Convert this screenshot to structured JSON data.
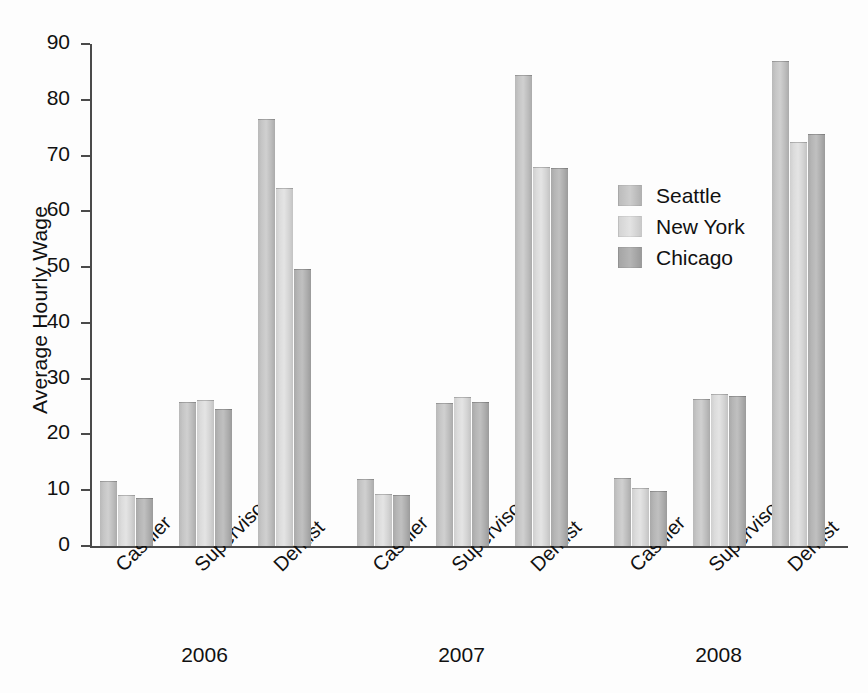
{
  "chart_data": {
    "type": "bar",
    "title": "",
    "xlabel": "",
    "ylabel": "Average Hourly Wage",
    "ylim": [
      0,
      90
    ],
    "ytick_values": [
      0,
      10,
      20,
      30,
      40,
      50,
      60,
      70,
      80,
      90
    ],
    "ytick_labels": [
      "0",
      "10",
      "20",
      "30",
      "40",
      "50",
      "60",
      "70",
      "80",
      "90"
    ],
    "grid": false,
    "legend_position": "upper-right-inside",
    "group_labels": [
      "2006",
      "2007",
      "2008"
    ],
    "categories": [
      "Cashier",
      "Supervisor",
      "Dentist"
    ],
    "series": [
      {
        "name": "Seattle",
        "color": "#c4c4c4",
        "values_by_group": {
          "2006": {
            "Cashier": 11.5,
            "Supervisor": 25.7,
            "Dentist": 76.3
          },
          "2007": {
            "Cashier": 11.8,
            "Supervisor": 25.5,
            "Dentist": 84.2
          },
          "2008": {
            "Cashier": 12.0,
            "Supervisor": 26.2,
            "Dentist": 86.7
          }
        }
      },
      {
        "name": "New York",
        "color": "#dcdcdc",
        "values_by_group": {
          "2006": {
            "Cashier": 9.0,
            "Supervisor": 26.0,
            "Dentist": 64.0
          },
          "2007": {
            "Cashier": 9.1,
            "Supervisor": 26.5,
            "Dentist": 67.8
          },
          "2008": {
            "Cashier": 10.3,
            "Supervisor": 27.1,
            "Dentist": 72.3
          }
        }
      },
      {
        "name": "Chicago",
        "color": "#ababab",
        "values_by_group": {
          "2006": {
            "Cashier": 8.4,
            "Supervisor": 24.3,
            "Dentist": 49.5
          },
          "2007": {
            "Cashier": 8.9,
            "Supervisor": 25.7,
            "Dentist": 67.6
          },
          "2008": {
            "Cashier": 9.7,
            "Supervisor": 26.7,
            "Dentist": 73.7
          }
        }
      }
    ]
  },
  "legend": {
    "items": [
      {
        "label": "Seattle"
      },
      {
        "label": "New York"
      },
      {
        "label": "Chicago"
      }
    ]
  }
}
